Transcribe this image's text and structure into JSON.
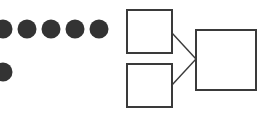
{
  "canvas": {
    "width": 265,
    "height": 118,
    "background_color": "#ffffff"
  },
  "diagram": {
    "title": "",
    "type": "node-and-box schematic",
    "stroke_color": "#3a3a3a",
    "fill_color": "#333333",
    "box_fill": "#ffffff",
    "box_stroke_width": 2,
    "connector_stroke_width": 1.4,
    "dots": {
      "label": "filled circles",
      "radius": 9.5,
      "color": "#333333",
      "rows": [
        {
          "name": "dot-row-top",
          "cy": 29,
          "centers_x": [
            3,
            27,
            51,
            75,
            99
          ],
          "count": 5,
          "first_clipped_at_left_edge": true
        },
        {
          "name": "dot-row-bottom",
          "cy": 72,
          "centers_x": [
            3
          ],
          "count": 1,
          "first_clipped_at_left_edge": true
        }
      ]
    },
    "boxes": [
      {
        "name": "small-box-top",
        "x": 127,
        "y": 10,
        "width": 45,
        "height": 43
      },
      {
        "name": "small-box-bottom",
        "x": 127,
        "y": 64,
        "width": 45,
        "height": 43
      },
      {
        "name": "large-box",
        "x": 196,
        "y": 30,
        "width": 60,
        "height": 60
      }
    ],
    "connectors": [
      {
        "name": "connector-top-to-large",
        "from": "small-box-top",
        "to": "large-box",
        "x1": 172,
        "y1": 33,
        "x2": 196,
        "y2": 59
      },
      {
        "name": "connector-bottom-to-large",
        "from": "small-box-bottom",
        "to": "large-box",
        "x1": 172,
        "y1": 85,
        "x2": 196,
        "y2": 59
      }
    ]
  }
}
